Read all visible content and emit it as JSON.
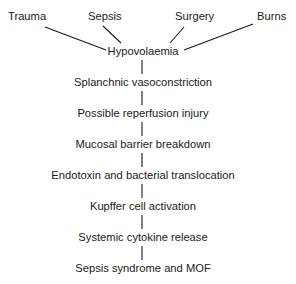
{
  "diagram": {
    "type": "flowchart",
    "causes": [
      {
        "label": "Trauma"
      },
      {
        "label": "Sepsis"
      },
      {
        "label": "Surgery"
      },
      {
        "label": "Burns"
      }
    ],
    "steps": [
      {
        "label": "Hypovolaemia"
      },
      {
        "label": "Splanchnic vasoconstriction"
      },
      {
        "label": "Possible reperfusion injury"
      },
      {
        "label": "Mucosal barrier breakdown"
      },
      {
        "label": "Endotoxin and bacterial translocation"
      },
      {
        "label": "Kupffer cell activation"
      },
      {
        "label": "Systemic cytokine release"
      },
      {
        "label": "Sepsis syndrome and MOF"
      }
    ],
    "colors": {
      "text": "#1a1a1a",
      "line": "#1a1a1a",
      "background": "#ffffff"
    }
  }
}
